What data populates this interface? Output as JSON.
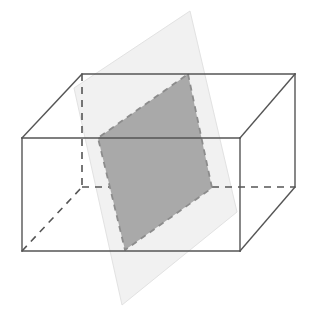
{
  "figure": {
    "title": "Plane intersecting a rectangular prism",
    "canvas": {
      "width": 309,
      "height": 318,
      "background": "#ffffff"
    },
    "colors": {
      "edge_stroke": "#555555",
      "hidden_edge_stroke": "#555555",
      "plane_fill": "#f1f1f1",
      "plane_stroke": "#e2e2e2",
      "cross_section_fill": "#a9a9a9",
      "cross_section_stroke": "#8c8c8c",
      "box_face_fill": "#ffffff"
    },
    "strokes": {
      "edge_width": 1.4,
      "hidden_edge_width": 1.6,
      "hidden_dash": "7 6",
      "cross_section_width": 1.8,
      "cross_section_dash": "6 5",
      "plane_width": 1
    },
    "prism": {
      "name": "rectangular-prism",
      "front_face": {
        "top_left": [
          22,
          138
        ],
        "top_right": [
          240,
          138
        ],
        "bottom_right": [
          240,
          251
        ],
        "bottom_left": [
          22,
          251
        ]
      },
      "back_face": {
        "top_left": [
          82,
          74
        ],
        "top_right": [
          295,
          74
        ],
        "bottom_right": [
          295,
          187
        ],
        "bottom_left": [
          82,
          187
        ]
      },
      "visible_edges": [
        {
          "name": "front-top",
          "from": [
            22,
            138
          ],
          "to": [
            240,
            138
          ]
        },
        {
          "name": "front-right",
          "from": [
            240,
            138
          ],
          "to": [
            240,
            251
          ]
        },
        {
          "name": "front-bottom",
          "from": [
            22,
            251
          ],
          "to": [
            240,
            251
          ]
        },
        {
          "name": "front-left",
          "from": [
            22,
            138
          ],
          "to": [
            22,
            251
          ]
        },
        {
          "name": "back-top",
          "from": [
            82,
            74
          ],
          "to": [
            295,
            74
          ]
        },
        {
          "name": "back-right",
          "from": [
            295,
            74
          ],
          "to": [
            295,
            187
          ]
        },
        {
          "name": "top-left-diagonal",
          "from": [
            22,
            138
          ],
          "to": [
            82,
            74
          ]
        },
        {
          "name": "top-right-diagonal",
          "from": [
            240,
            138
          ],
          "to": [
            295,
            74
          ]
        },
        {
          "name": "bottom-right-diagonal",
          "from": [
            240,
            251
          ],
          "to": [
            295,
            187
          ]
        }
      ],
      "hidden_edges": [
        {
          "name": "back-left-vertical",
          "from": [
            82,
            74
          ],
          "to": [
            82,
            187
          ]
        },
        {
          "name": "back-bottom",
          "from": [
            82,
            187
          ],
          "to": [
            295,
            187
          ]
        },
        {
          "name": "bottom-left-diagonal",
          "from": [
            22,
            251
          ],
          "to": [
            82,
            187
          ]
        }
      ]
    },
    "plane": {
      "name": "cutting-plane",
      "vertices": [
        [
          190,
          11
        ],
        [
          237,
          212
        ],
        [
          122,
          305
        ],
        [
          74,
          88
        ]
      ],
      "label": "cutting plane"
    },
    "cross_section": {
      "name": "cross-section-quadrilateral",
      "vertices": [
        [
          188,
          74
        ],
        [
          212,
          188
        ],
        [
          125,
          250
        ],
        [
          98,
          138
        ]
      ],
      "label": "cross section",
      "edge_style": "dashed"
    }
  }
}
